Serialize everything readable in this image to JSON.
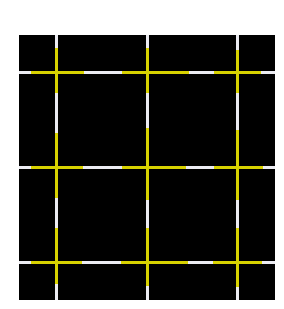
{
  "canvas": {
    "width": 284,
    "height": 309,
    "background": "#ffffff"
  },
  "board": {
    "x": 19,
    "y": 35,
    "width": 256,
    "height": 265,
    "color": "#000000"
  },
  "colors": {
    "white": "#ececf2",
    "yellow": "#d8d200"
  },
  "line_thickness": 3,
  "vertical_lines": [
    {
      "x": 55,
      "segments": [
        {
          "from": 35,
          "to": 48,
          "color": "white"
        },
        {
          "from": 48,
          "to": 93,
          "color": "yellow"
        },
        {
          "from": 93,
          "to": 133,
          "color": "white"
        },
        {
          "from": 133,
          "to": 198,
          "color": "yellow"
        },
        {
          "from": 198,
          "to": 228,
          "color": "white"
        },
        {
          "from": 228,
          "to": 284,
          "color": "yellow"
        },
        {
          "from": 284,
          "to": 300,
          "color": "white"
        }
      ]
    },
    {
      "x": 146,
      "segments": [
        {
          "from": 35,
          "to": 48,
          "color": "white"
        },
        {
          "from": 48,
          "to": 93,
          "color": "yellow"
        },
        {
          "from": 93,
          "to": 128,
          "color": "white"
        },
        {
          "from": 128,
          "to": 200,
          "color": "yellow"
        },
        {
          "from": 200,
          "to": 228,
          "color": "white"
        },
        {
          "from": 228,
          "to": 286,
          "color": "yellow"
        },
        {
          "from": 286,
          "to": 300,
          "color": "white"
        }
      ]
    },
    {
      "x": 236,
      "segments": [
        {
          "from": 35,
          "to": 50,
          "color": "white"
        },
        {
          "from": 50,
          "to": 93,
          "color": "yellow"
        },
        {
          "from": 93,
          "to": 130,
          "color": "white"
        },
        {
          "from": 130,
          "to": 200,
          "color": "yellow"
        },
        {
          "from": 200,
          "to": 228,
          "color": "white"
        },
        {
          "from": 228,
          "to": 287,
          "color": "yellow"
        },
        {
          "from": 287,
          "to": 300,
          "color": "white"
        }
      ]
    }
  ],
  "horizontal_lines": [
    {
      "y": 71,
      "segments": [
        {
          "from": 19,
          "to": 31,
          "color": "white"
        },
        {
          "from": 31,
          "to": 84,
          "color": "yellow"
        },
        {
          "from": 84,
          "to": 122,
          "color": "white"
        },
        {
          "from": 122,
          "to": 189,
          "color": "yellow"
        },
        {
          "from": 189,
          "to": 214,
          "color": "white"
        },
        {
          "from": 214,
          "to": 261,
          "color": "yellow"
        },
        {
          "from": 261,
          "to": 275,
          "color": "white"
        }
      ]
    },
    {
      "y": 166,
      "segments": [
        {
          "from": 19,
          "to": 31,
          "color": "white"
        },
        {
          "from": 31,
          "to": 83,
          "color": "yellow"
        },
        {
          "from": 83,
          "to": 122,
          "color": "white"
        },
        {
          "from": 122,
          "to": 186,
          "color": "yellow"
        },
        {
          "from": 186,
          "to": 214,
          "color": "white"
        },
        {
          "from": 214,
          "to": 263,
          "color": "yellow"
        },
        {
          "from": 263,
          "to": 275,
          "color": "white"
        }
      ]
    },
    {
      "y": 261,
      "segments": [
        {
          "from": 19,
          "to": 31,
          "color": "white"
        },
        {
          "from": 31,
          "to": 82,
          "color": "yellow"
        },
        {
          "from": 82,
          "to": 121,
          "color": "white"
        },
        {
          "from": 121,
          "to": 188,
          "color": "yellow"
        },
        {
          "from": 188,
          "to": 213,
          "color": "white"
        },
        {
          "from": 213,
          "to": 262,
          "color": "yellow"
        },
        {
          "from": 262,
          "to": 275,
          "color": "white"
        }
      ]
    }
  ]
}
